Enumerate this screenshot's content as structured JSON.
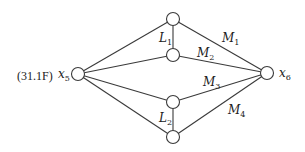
{
  "equation_label": "(31.1F)",
  "nodes": {
    "x5": {
      "label": "x",
      "sub": "5"
    },
    "x6": {
      "label": "x",
      "sub": "6"
    }
  },
  "edge_labels": {
    "L1": {
      "label": "L",
      "sub": "1"
    },
    "L2": {
      "label": "L",
      "sub": "2"
    },
    "M1": {
      "label": "M",
      "sub": "1"
    },
    "M2": {
      "label": "M",
      "sub": "2"
    },
    "M3": {
      "label": "M",
      "sub": "3"
    },
    "M4": {
      "label": "M",
      "sub": "4"
    }
  }
}
